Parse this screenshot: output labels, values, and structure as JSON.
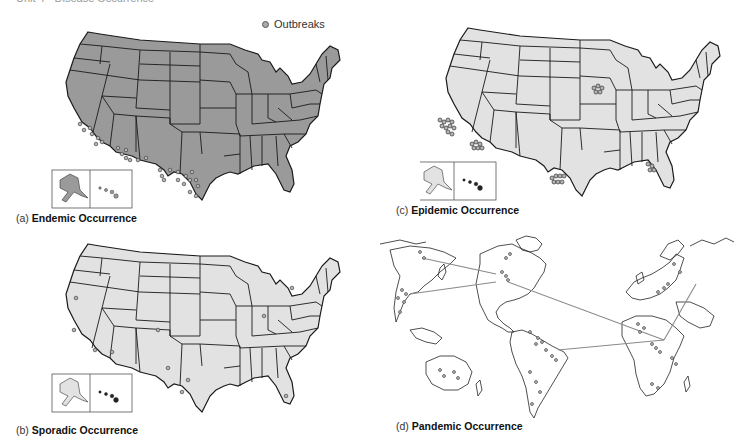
{
  "page": {
    "header_fragment": "Unit 4 · Disease Occurrence"
  },
  "legend": {
    "label": "Outbreaks",
    "icon": "outbreak-dot-icon"
  },
  "colors": {
    "endemic_fill": "#9a9a9a",
    "light_fill": "#e2e2e2",
    "state_border": "#1a1a1a",
    "dot_fill": "#b0b0b0",
    "dot_stroke": "#444444",
    "connector_line": "#8a8a8a"
  },
  "panels": [
    {
      "id": "a",
      "letter": "(a)",
      "title": "Endemic Occurrence",
      "map": "us",
      "fill": "dark",
      "outbreak_pattern": "scattered across southwest border states (California, Arizona, New Mexico, Texas)"
    },
    {
      "id": "b",
      "letter": "(b)",
      "title": "Sporadic Occurrence",
      "map": "us",
      "fill": "light",
      "outbreak_pattern": "isolated single cases across the country"
    },
    {
      "id": "c",
      "letter": "(c)",
      "title": "Epidemic Occurrence",
      "map": "us",
      "fill": "light",
      "outbreak_pattern": "dense clusters in Los Angeles, Phoenix, Chicago, South Texas, North Florida"
    },
    {
      "id": "d",
      "letter": "(d)",
      "title": "Pandemic Occurrence",
      "map": "world",
      "fill": "none",
      "outbreak_pattern": "clusters on multiple continents connected by transmission lines"
    }
  ]
}
